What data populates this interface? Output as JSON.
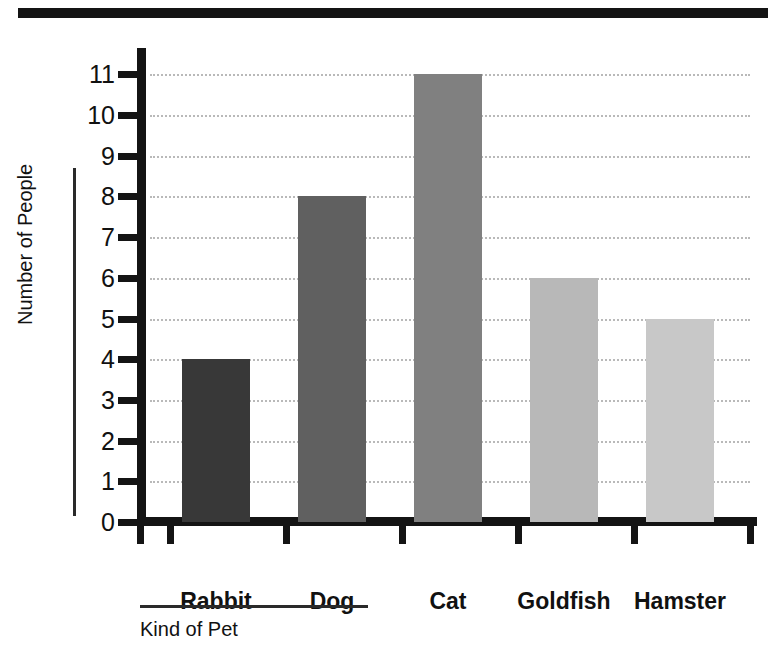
{
  "chart_data": {
    "type": "bar",
    "title": "",
    "xlabel": "Kind of Pet",
    "ylabel": "Number of People",
    "categories": [
      "Rabbit",
      "Dog",
      "Cat",
      "Goldfish",
      "Hamster"
    ],
    "values": [
      4,
      8,
      11,
      6,
      5
    ],
    "bar_colors": [
      "#383838",
      "#606060",
      "#808080",
      "#b8b8b8",
      "#c8c8c8"
    ],
    "ylim": [
      0,
      11.6
    ],
    "yticks": [
      0,
      1,
      2,
      3,
      4,
      5,
      6,
      7,
      8,
      9,
      10,
      11
    ],
    "ytick_labels": [
      "0",
      "1",
      "2",
      "3",
      "4",
      "5",
      "6",
      "7",
      "8",
      "9",
      "10",
      "11"
    ],
    "grid": true,
    "grid_axis": "y",
    "grid_style": "dotted",
    "grid_color": "#b9b9b9",
    "legend": false,
    "legend_position": "none",
    "axis_color": "#141414"
  },
  "decor": {
    "top_rule_color": "#141414"
  }
}
